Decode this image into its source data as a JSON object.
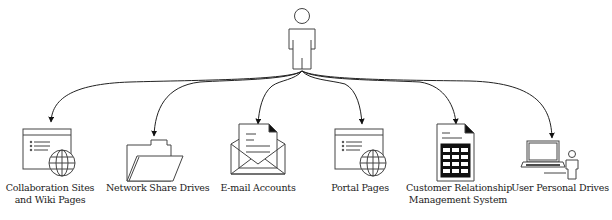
{
  "diagram": {
    "root": {
      "name": "user",
      "icon": "person-icon"
    },
    "nodes": [
      {
        "id": "collab",
        "icon": "browser-globe-icon",
        "label_lines": [
          "Collaboration Sites",
          "and Wiki Pages"
        ]
      },
      {
        "id": "network",
        "icon": "folder-icon",
        "label_lines": [
          "Network Share Drives"
        ]
      },
      {
        "id": "email",
        "icon": "envelope-document-icon",
        "label_lines": [
          "E-mail Accounts"
        ]
      },
      {
        "id": "portal",
        "icon": "browser-globe-icon",
        "label_lines": [
          "Portal Pages"
        ]
      },
      {
        "id": "crm",
        "icon": "spreadsheet-document-icon",
        "label_lines": [
          "Customer Relationship",
          "Management System"
        ]
      },
      {
        "id": "personal",
        "icon": "laptop-user-icon",
        "label_lines": [
          "User Personal Drives"
        ]
      }
    ],
    "colors": {
      "stroke": "#333333",
      "text": "#222222",
      "background": "#ffffff"
    }
  }
}
